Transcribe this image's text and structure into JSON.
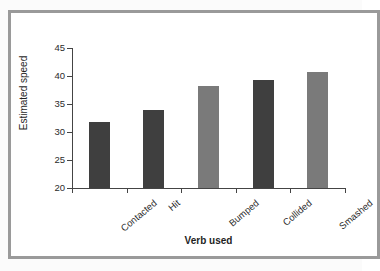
{
  "figure": {
    "frame_color": "#9a9a9a",
    "background_color": "#ffffff"
  },
  "chart_data": {
    "type": "bar",
    "title": "",
    "subtitle": "",
    "xlabel": "Verb used",
    "ylabel": "Estimated speed",
    "categories": [
      "Contacted",
      "Hit",
      "Bumped",
      "Collided",
      "Smashed"
    ],
    "values": [
      31.8,
      34.0,
      38.2,
      39.2,
      40.8
    ],
    "bar_colors": [
      "#3f3f3f",
      "#3f3f3f",
      "#7a7a7a",
      "#3f3f3f",
      "#7a7a7a"
    ],
    "ylim": [
      20,
      45
    ],
    "ytick_labels": [
      "45",
      "40",
      "35",
      "30",
      "25",
      "20"
    ],
    "ytick_values": [
      45,
      40,
      35,
      30,
      25,
      20
    ],
    "grid": false,
    "legend": null,
    "legend_position": "none",
    "annotations": []
  }
}
